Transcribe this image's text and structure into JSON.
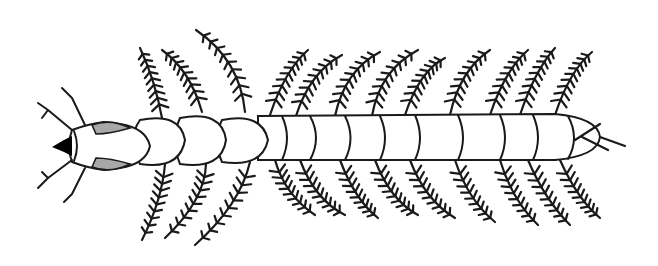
{
  "figure": {
    "alt_text": "Larva illustration, dorsal view",
    "colors": {
      "stroke": "#1a1a1a",
      "background": "#ffffff",
      "eye_fill": "#a8a8a8",
      "mandible_fill": "#000000"
    },
    "parts": {
      "head": "head",
      "thorax_segments": 3,
      "abdominal_segments": 9,
      "gills_dorsal_count": 12,
      "gills_ventral_count": 12
    }
  }
}
